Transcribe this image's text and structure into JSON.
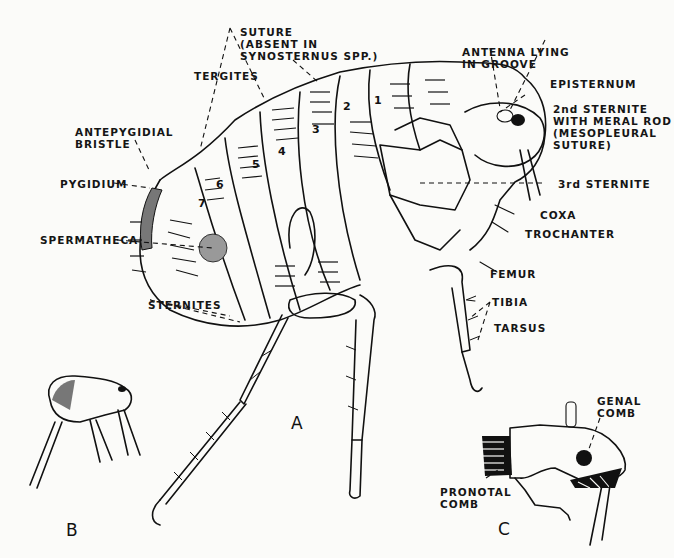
{
  "figure": {
    "panels": [
      {
        "id": "A",
        "label": "A",
        "description": "Female flea, detailed lateral view"
      },
      {
        "id": "B",
        "label": "B",
        "description": "Whole flea, small lateral view"
      },
      {
        "id": "C",
        "label": "C",
        "description": "Head and pronotum showing combs"
      }
    ]
  },
  "labels_A": {
    "suture": "SUTURE\n(ABSENT IN\nSYNOSTERNUS SPP.)",
    "antenna": "ANTENNA LYING\nIN GROOVE",
    "episternum": "EPISTERNUM",
    "sternite2": "2nd STERNITE\nWITH MERAL ROD\n(MESOPLEURAL\nSUTURE)",
    "tergites": "TERGITES",
    "antepygidial": "ANTEPYGIDIAL\nBRISTLE",
    "pygidium": "PYGIDIUM",
    "sternite3": "3rd STERNITE",
    "coxa": "COXA",
    "trochanter": "TROCHANTER",
    "spermatheca": "SPERMATHECA",
    "femur": "FEMUR",
    "tibia": "TIBIA",
    "sternites": "STERNITES",
    "tarsus": "TARSUS"
  },
  "segment_numbers": [
    "1",
    "2",
    "3",
    "4",
    "5",
    "6",
    "7"
  ],
  "labels_C": {
    "genal_comb": "GENAL\nCOMB",
    "pronotal_comb": "PRONOTAL\nCOMB"
  }
}
